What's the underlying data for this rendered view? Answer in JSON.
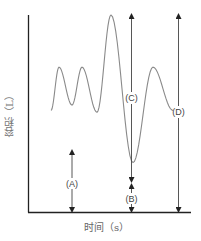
{
  "figure": {
    "type": "spirometry-diagram",
    "y_axis_label": "容积（L）",
    "x_axis_label": "时间（s）",
    "colors": {
      "axis": "#222222",
      "curve": "#888888",
      "arrow": "#333333",
      "text": "#444444"
    }
  },
  "chart_data": {
    "type": "line",
    "title": "",
    "xlabel": "时间（s）",
    "ylabel": "容积（L）",
    "grid": false,
    "series": [
      {
        "name": "volume",
        "x": [
          0,
          0.08,
          0.21,
          0.31,
          0.46,
          0.6,
          0.82,
          1.02,
          1.22
        ],
        "y": [
          0.47,
          0.71,
          0.5,
          0.71,
          0.46,
          1.0,
          0.18,
          0.71,
          0.47
        ],
        "points_label": [
          "start",
          "tidal-peak",
          "tidal-trough",
          "tidal-peak",
          "trough",
          "max-inspiration",
          "max-expiration",
          "tidal-peak",
          "end"
        ]
      }
    ],
    "annotations": [
      {
        "label": "(A)",
        "meaning": "from x-axis to tidal trough"
      },
      {
        "label": "(B)",
        "meaning": "from x-axis to maximal expiration trough"
      },
      {
        "label": "(C)",
        "meaning": "from maximal expiration to maximal inspiration"
      },
      {
        "label": "(D)",
        "meaning": "from x-axis to maximal inspiration level"
      }
    ]
  }
}
